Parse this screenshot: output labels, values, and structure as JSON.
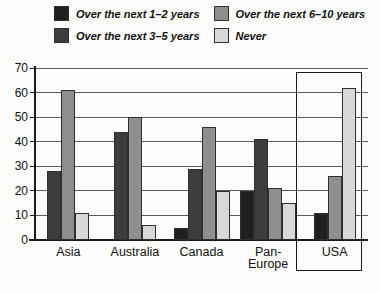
{
  "chart_data": {
    "type": "bar",
    "title": "",
    "xlabel": "",
    "ylabel": "",
    "categories": [
      "Asia",
      "Australia",
      "Canada",
      "Pan-Europe",
      "USA"
    ],
    "category_label_lines": [
      [
        "Asia"
      ],
      [
        "Australia"
      ],
      [
        "Canada"
      ],
      [
        "Pan-",
        "Europe"
      ],
      [
        "USA"
      ]
    ],
    "series": [
      {
        "name": "Over the next 1–2 years",
        "color": "#1f1f1f",
        "values": [
          null,
          null,
          5,
          20,
          11
        ]
      },
      {
        "name": "Over the next 3–5 years",
        "color": "#3d3d3d",
        "values": [
          28,
          44,
          29,
          41,
          null
        ]
      },
      {
        "name": "Over the next 6–10 years",
        "color": "#8e8e8e",
        "values": [
          61,
          50,
          46,
          21,
          26
        ]
      },
      {
        "name": "Never",
        "color": "#d8d8d8",
        "values": [
          11,
          6,
          20,
          15,
          62
        ]
      }
    ],
    "ylim": [
      0,
      70
    ],
    "yticks": [
      0,
      10,
      20,
      30,
      40,
      50,
      60,
      70
    ],
    "grid": true,
    "legend_position": "top",
    "highlight_box": {
      "category": "USA"
    },
    "colors": {
      "gridline": "#5a5a5a",
      "axis": "#1a1a1a",
      "background": "#fcfcfa"
    }
  }
}
